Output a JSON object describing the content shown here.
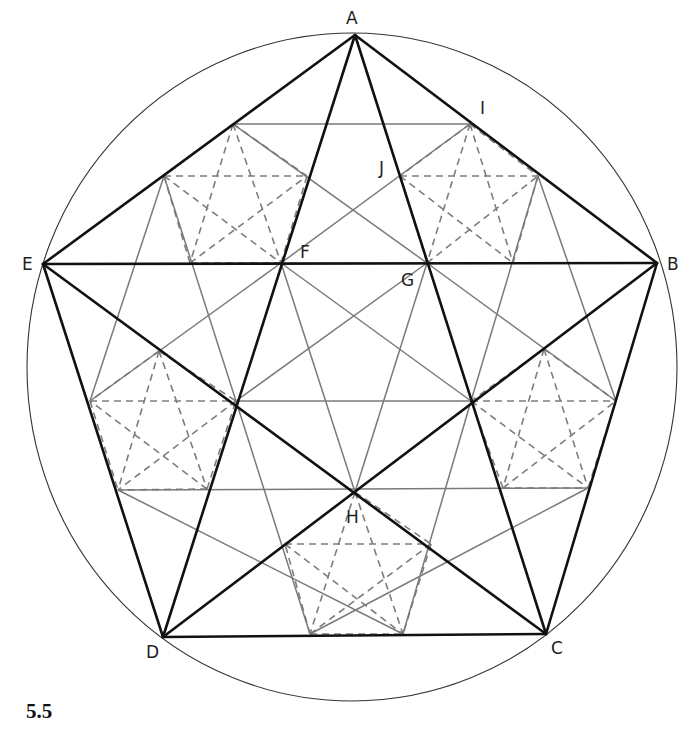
{
  "figure": {
    "label": "5.5",
    "colors": {
      "thick": "#111111",
      "gray": "#7a7a7a",
      "circle": "#333333"
    },
    "circle": {
      "cx": 352,
      "cy": 367,
      "rx": 325,
      "ry": 334
    },
    "points": {
      "A": [
        355,
        35
      ],
      "B": [
        657,
        263
      ],
      "C": [
        546,
        634
      ],
      "D": [
        163,
        637
      ],
      "E": [
        43,
        264
      ],
      "F": [
        281,
        263
      ],
      "G": [
        427,
        263
      ],
      "H": [
        355,
        492
      ],
      "I": [
        470,
        124
      ],
      "J": [
        400,
        176
      ],
      "K": [
        471,
        401
      ],
      "L": [
        236,
        401
      ],
      "P1": [
        233,
        124
      ],
      "P3": [
        538,
        176
      ],
      "P4": [
        616,
        401
      ],
      "P5": [
        588,
        488
      ],
      "P6": [
        403,
        634
      ],
      "P7": [
        310,
        634
      ],
      "P8": [
        118,
        490
      ],
      "P9": [
        90,
        401
      ],
      "P10": [
        164,
        176
      ],
      "R1": [
        307,
        176
      ],
      "R2": [
        190,
        263
      ],
      "R3": [
        513,
        263
      ],
      "R4": [
        159,
        351
      ],
      "R5": [
        207,
        489
      ],
      "R6": [
        544,
        349
      ],
      "R7": [
        503,
        488
      ],
      "R8": [
        285,
        544
      ],
      "R9": [
        431,
        544
      ]
    },
    "thick_lines": [
      [
        "A",
        "B"
      ],
      [
        "B",
        "C"
      ],
      [
        "C",
        "D"
      ],
      [
        "D",
        "E"
      ],
      [
        "E",
        "A"
      ],
      [
        "A",
        "C"
      ],
      [
        "A",
        "D"
      ],
      [
        "B",
        "D"
      ],
      [
        "B",
        "E"
      ],
      [
        "C",
        "E"
      ]
    ],
    "gray_lines": [
      [
        "P1",
        "I"
      ],
      [
        "P1",
        "G"
      ],
      [
        "I",
        "F"
      ],
      [
        "P10",
        "P9"
      ],
      [
        "P10",
        "L"
      ],
      [
        "P9",
        "F"
      ],
      [
        "P3",
        "P4"
      ],
      [
        "P3",
        "K"
      ],
      [
        "P4",
        "G"
      ],
      [
        "P8",
        "P5"
      ],
      [
        "P8",
        "P6"
      ],
      [
        "P5",
        "P7"
      ],
      [
        "P7",
        "L"
      ],
      [
        "P6",
        "K"
      ],
      [
        "F",
        "K"
      ],
      [
        "F",
        "H"
      ],
      [
        "G",
        "L"
      ],
      [
        "G",
        "H"
      ],
      [
        "L",
        "K"
      ]
    ],
    "dashed_stars": [
      [
        "P1",
        "R2",
        "P10",
        "R1",
        "F"
      ],
      [
        "I",
        "G",
        "J",
        "P3",
        "R3"
      ],
      [
        "R4",
        "R5",
        "P9",
        "L",
        "P8"
      ],
      [
        "R6",
        "R7",
        "K",
        "P4",
        "P5"
      ],
      [
        "H",
        "P7",
        "R8",
        "R9",
        "P6"
      ]
    ],
    "labels": [
      {
        "text": "A",
        "x": 346,
        "y": 24
      },
      {
        "text": "B",
        "x": 667,
        "y": 270
      },
      {
        "text": "C",
        "x": 551,
        "y": 654
      },
      {
        "text": "D",
        "x": 146,
        "y": 658
      },
      {
        "text": "E",
        "x": 22,
        "y": 270
      },
      {
        "text": "F",
        "x": 300,
        "y": 258
      },
      {
        "text": "G",
        "x": 401,
        "y": 286
      },
      {
        "text": "H",
        "x": 346,
        "y": 523
      },
      {
        "text": "I",
        "x": 480,
        "y": 114
      },
      {
        "text": "J",
        "x": 379,
        "y": 174
      }
    ]
  }
}
